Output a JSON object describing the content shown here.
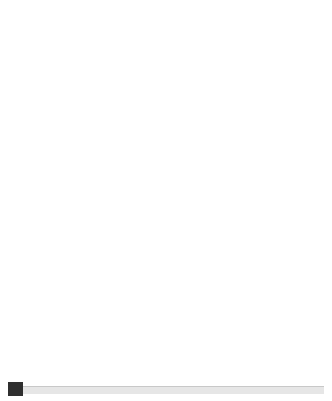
{
  "chart_data": {
    "type": "line",
    "title": "",
    "xlabel": "Age",
    "ylabel": "Heart rate (beats per minute)",
    "xlim": [
      20,
      70
    ],
    "ylim": [
      55,
      205
    ],
    "xticks": [
      20,
      30,
      40,
      50,
      60,
      70
    ],
    "yticks": [
      80,
      100,
      120,
      140,
      160,
      180,
      200
    ],
    "grid": true,
    "legend": "none",
    "x": [
      20,
      70
    ],
    "series": [
      {
        "name": "100% maximum heart rate",
        "percent": 100,
        "values": [
          200,
          150
        ]
      },
      {
        "name": "80% maximum heart rate",
        "percent": 80,
        "values": [
          160,
          120
        ]
      },
      {
        "name": "70% maximum heart rate",
        "percent": 70,
        "values": [
          140,
          105
        ]
      },
      {
        "name": "60% maximum heart rate",
        "percent": 60,
        "values": [
          120,
          90
        ]
      },
      {
        "name": "40% maximum heart rate",
        "percent": 40,
        "values": [
          80,
          60
        ]
      }
    ],
    "annotations": [
      {
        "id": "competitive",
        "lines": [
          "Competitive",
          "training 80–100%",
          "maximum heart rate"
        ],
        "indents": [
          0,
          0,
          0
        ],
        "x": 24.5,
        "y": 179
      },
      {
        "id": "aerobic",
        "lines": [
          "Aerobic",
          "workout 70–80%",
          "maximum heart",
          "rate"
        ],
        "indents": [
          0,
          0,
          14,
          32
        ],
        "x": 24.0,
        "y": 153
      },
      {
        "id": "weight-management",
        "lines": [
          "Weight",
          "management",
          "60–70% maximum",
          "heart rate"
        ],
        "indents": [
          0,
          0,
          14,
          32
        ],
        "x": 23.8,
        "y": 133
      },
      {
        "id": "moderate-activity",
        "lines": [
          "Moderate activity",
          "40–60% maximum heart rate"
        ],
        "indents": [
          0,
          0
        ],
        "x": 24.0,
        "y": 105
      }
    ]
  },
  "axes": {
    "x_title": "Age",
    "y_title": "Heart rate (beats per minute)",
    "x_tick_labels": [
      "20",
      "30",
      "40",
      "50",
      "60",
      "70"
    ],
    "y_tick_labels": [
      "80",
      "100",
      "120",
      "140",
      "160",
      "180",
      "200"
    ]
  },
  "colors": {
    "line": "#4a4a4a",
    "band": "#ececec",
    "grid": "#cfcfcf",
    "axis": "#b9b9b9",
    "text": "#2b2b2b",
    "footer_marker": "#2f2f2f",
    "footer_rule": "#e6e6e6"
  },
  "footer": {
    "marker_label": "page-marker",
    "rule_label": "horizontal-rule"
  }
}
